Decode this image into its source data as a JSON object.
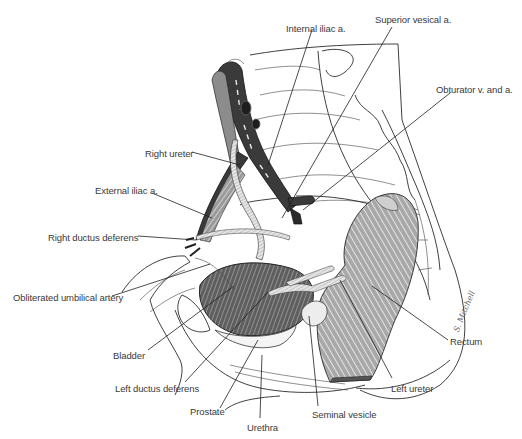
{
  "figure": {
    "signature": "S. Mitchell",
    "labels": [
      {
        "id": "internal-iliac-a",
        "text": "Internal iliac a.",
        "x": 286,
        "y": 24
      },
      {
        "id": "superior-vesical-a",
        "text": "Superior vesical a.",
        "x": 375,
        "y": 15
      },
      {
        "id": "obturator-v-and-a",
        "text": "Obturator v. and a.",
        "x": 436,
        "y": 85
      },
      {
        "id": "right-ureter",
        "text": "Right ureter",
        "x": 145,
        "y": 149
      },
      {
        "id": "external-iliac-a",
        "text": "External iliac a.",
        "x": 95,
        "y": 186
      },
      {
        "id": "right-ductus-deferens",
        "text": "Right ductus deferens",
        "x": 48,
        "y": 233
      },
      {
        "id": "obliterated-umbilical-artery",
        "text": "Obliterated umbilical artery",
        "x": 13,
        "y": 293
      },
      {
        "id": "bladder",
        "text": "Bladder",
        "x": 113,
        "y": 351
      },
      {
        "id": "left-ductus-deferens",
        "text": "Left ductus deferens",
        "x": 115,
        "y": 384
      },
      {
        "id": "prostate",
        "text": "Prostate",
        "x": 190,
        "y": 407
      },
      {
        "id": "urethra",
        "text": "Urethra",
        "x": 247,
        "y": 423
      },
      {
        "id": "seminal-vesicle",
        "text": "Seminal vesicle",
        "x": 312,
        "y": 410
      },
      {
        "id": "left-ureter",
        "text": "Left ureter",
        "x": 391,
        "y": 384
      },
      {
        "id": "rectum",
        "text": "Rectum",
        "x": 450,
        "y": 337
      }
    ]
  }
}
